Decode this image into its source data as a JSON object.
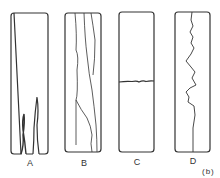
{
  "figure": {
    "tag": "(b)",
    "panels": [
      {
        "label": "A",
        "description": "specimen with short cracks from bottom edge"
      },
      {
        "label": "B",
        "description": "specimen with long longitudinal cracks"
      },
      {
        "label": "C",
        "description": "specimen with transverse fracture"
      },
      {
        "label": "D",
        "description": "specimen with jagged longitudinal crack"
      }
    ]
  },
  "colors": {
    "stroke": "#333333",
    "background": "#ffffff"
  }
}
